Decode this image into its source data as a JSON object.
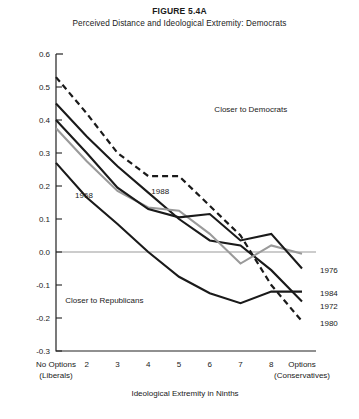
{
  "figure": {
    "title": "FIGURE 5.4A",
    "subtitle": "Perceived Distance and Ideological Extremity: Democrats"
  },
  "chart_data": {
    "type": "line",
    "title": "Perceived Distance and Ideological Extremity: Democrats",
    "xlabel": "Ideological Extremity in Ninths",
    "ylabel": "",
    "xlim": [
      0,
      8
    ],
    "ylim": [
      -0.3,
      0.6
    ],
    "grid": false,
    "legend_position": "inline-right",
    "zero_line": true,
    "categories": [
      "No Options\n(Liberals)",
      "2",
      "3",
      "4",
      "5",
      "6",
      "7",
      "8",
      "Options\n(Conservatives)"
    ],
    "category_labels": [
      {
        "line1": "No Options",
        "line2": "(Liberals)"
      },
      {
        "line1": "2",
        "line2": ""
      },
      {
        "line1": "3",
        "line2": ""
      },
      {
        "line1": "4",
        "line2": ""
      },
      {
        "line1": "5",
        "line2": ""
      },
      {
        "line1": "6",
        "line2": ""
      },
      {
        "line1": "7",
        "line2": ""
      },
      {
        "line1": "8",
        "line2": ""
      },
      {
        "line1": "Options",
        "line2": "(Conservatives)"
      }
    ],
    "ytick_labels": [
      "0.6",
      "0.5",
      "0.4",
      "0.3",
      "0.2",
      "0.1",
      "0.0",
      "-0.1",
      "-0.2",
      "-0.3"
    ],
    "ytick_values": [
      0.6,
      0.5,
      0.4,
      0.3,
      0.2,
      0.1,
      0.0,
      -0.1,
      -0.2,
      -0.3
    ],
    "series": [
      {
        "name": "1980",
        "style": "dashed",
        "color": "#1a1a1a",
        "width": 2.2,
        "values": [
          0.53,
          0.42,
          0.3,
          0.23,
          0.23,
          0.14,
          0.05,
          -0.1,
          -0.21
        ]
      },
      {
        "name": "1972",
        "style": "solid",
        "color": "#1a1a1a",
        "width": 2.1,
        "values": [
          0.45,
          0.35,
          0.26,
          0.18,
          0.1,
          0.035,
          0.02,
          -0.055,
          -0.15
        ]
      },
      {
        "name": "1988",
        "style": "solid",
        "color": "#9a9a9a",
        "width": 2.1,
        "values": [
          0.375,
          0.275,
          0.185,
          0.135,
          0.125,
          0.055,
          -0.035,
          0.02,
          -0.005
        ]
      },
      {
        "name": "1976",
        "style": "solid",
        "color": "#1a1a1a",
        "width": 2.1,
        "values": [
          0.4,
          0.3,
          0.195,
          0.13,
          0.105,
          0.115,
          0.035,
          0.055,
          -0.05
        ]
      },
      {
        "name": "1984",
        "style": "solid",
        "color": "#1a1a1a",
        "width": 2.1,
        "values": [
          0.27,
          0.165,
          0.085,
          0.0,
          -0.075,
          -0.125,
          -0.155,
          -0.12,
          -0.12
        ]
      }
    ],
    "annotations": [
      {
        "text": "Closer to Democrats",
        "x": 5.15,
        "y": 0.425,
        "anchor": "start"
      },
      {
        "text": "Closer to Republicans",
        "x": 0.3,
        "y": -0.155,
        "anchor": "start"
      },
      {
        "text": "1968",
        "x": 0.62,
        "y": 0.165,
        "anchor": "start"
      },
      {
        "text": "1988",
        "x": 3.1,
        "y": 0.175,
        "anchor": "start"
      }
    ],
    "right_labels": [
      {
        "text": "1976",
        "y": -0.055
      },
      {
        "text": "1984",
        "y": -0.125
      },
      {
        "text": "1972",
        "y": -0.165
      },
      {
        "text": "1980",
        "y": -0.215
      }
    ]
  }
}
